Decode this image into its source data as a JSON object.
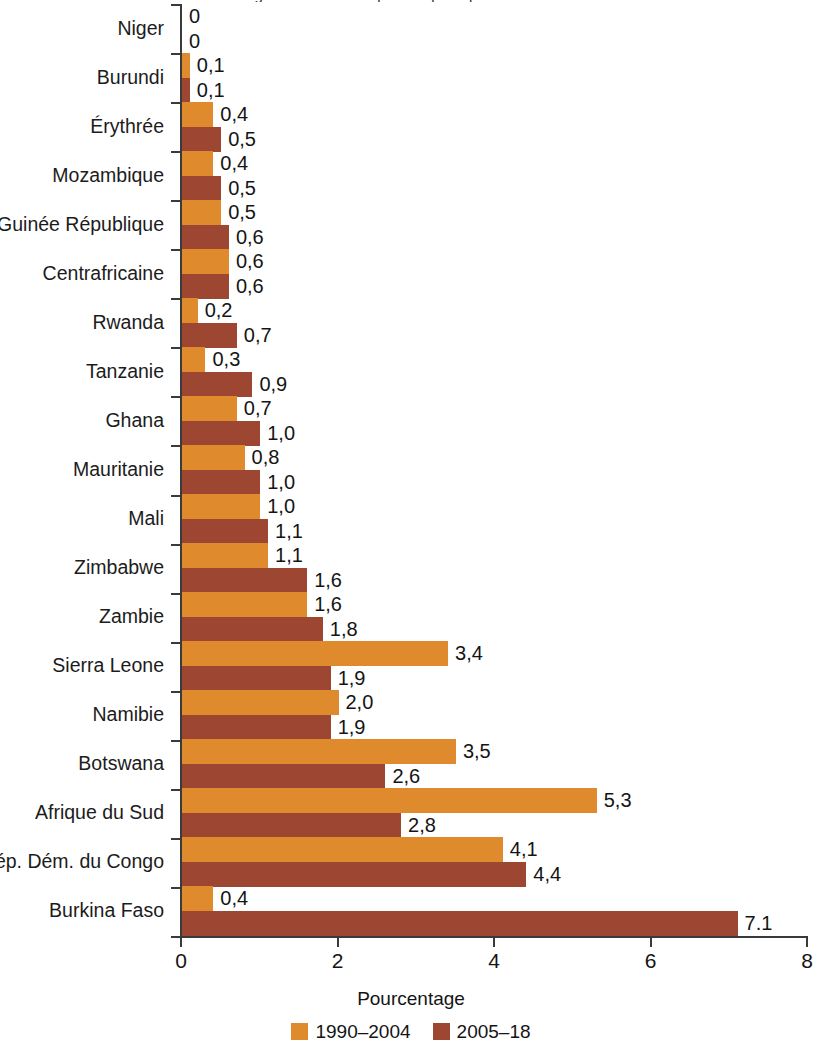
{
  "title_sliver": "Figure : Part des dépenses publiques consacrées",
  "chart_data": {
    "type": "bar",
    "orientation": "horizontal",
    "title": "",
    "xlabel": "Pourcentage",
    "ylabel": "",
    "xlim": [
      0,
      8
    ],
    "xticks": [
      0,
      2,
      4,
      6,
      8
    ],
    "xtick_labels": [
      "0",
      "2",
      "4",
      "6",
      "8"
    ],
    "grid": false,
    "legend_position": "bottom",
    "categories": [
      "Niger",
      "Burundi",
      "Érythrée",
      "Mozambique",
      "Guinée République",
      "Centrafricaine",
      "Rwanda",
      "Tanzanie",
      "Ghana",
      "Mauritanie",
      "Mali",
      "Zimbabwe",
      "Zambie",
      "Sierra Leone",
      "Namibie",
      "Botswana",
      "Afrique du Sud",
      "Rép. Dém. du Congo",
      "Burkina Faso"
    ],
    "series": [
      {
        "name": "1990–2004",
        "color": "#e08a2e",
        "values": [
          0,
          0.1,
          0.4,
          0.4,
          0.5,
          0.6,
          0.2,
          0.3,
          0.7,
          0.8,
          1.0,
          1.1,
          1.6,
          3.4,
          2.0,
          3.5,
          5.3,
          4.1,
          0.4
        ],
        "labels": [
          "0",
          "0,1",
          "0,4",
          "0,4",
          "0,5",
          "0,6",
          "0,2",
          "0,3",
          "0,7",
          "0,8",
          "1,0",
          "1,1",
          "1,6",
          "3,4",
          "2,0",
          "3,5",
          "5,3",
          "4,1",
          "0,4"
        ]
      },
      {
        "name": "2005–18",
        "color": "#9d4631",
        "values": [
          0,
          0.1,
          0.5,
          0.5,
          0.6,
          0.6,
          0.7,
          0.9,
          1.0,
          1.0,
          1.1,
          1.6,
          1.8,
          1.9,
          1.9,
          2.6,
          2.8,
          4.4,
          7.1
        ],
        "labels": [
          "0",
          "0,1",
          "0,5",
          "0,5",
          "0,6",
          "0,6",
          "0,7",
          "0,9",
          "1,0",
          "1,0",
          "1,1",
          "1,6",
          "1,8",
          "1,9",
          "1,9",
          "2,6",
          "2,8",
          "4,4",
          "7.1"
        ]
      }
    ],
    "legend": [
      {
        "label": "1990–2004",
        "color": "#e08a2e"
      },
      {
        "label": "2005–18",
        "color": "#9d4631"
      }
    ]
  }
}
